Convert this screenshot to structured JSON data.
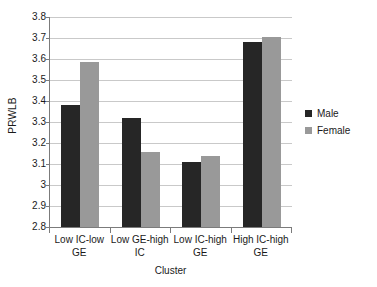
{
  "chart_data": {
    "type": "bar",
    "title": "",
    "subtitle": "",
    "xlabel": "Cluster",
    "ylabel": "PRWLB",
    "categories": [
      "Low IC-low GE",
      "Low GE-high IC",
      "Low IC-high GE",
      "High IC-high GE"
    ],
    "category_lines": [
      [
        "Low IC-low",
        "GE"
      ],
      [
        "Low GE-high",
        "IC"
      ],
      [
        "Low IC-high",
        "GE"
      ],
      [
        "High IC-high",
        "GE"
      ]
    ],
    "series": [
      {
        "name": "Male",
        "color": "#262626",
        "values": [
          3.38,
          3.32,
          3.11,
          3.68
        ]
      },
      {
        "name": "Female",
        "color": "#999999",
        "values": [
          3.585,
          3.155,
          3.14,
          3.705
        ]
      }
    ],
    "ylim": [
      2.8,
      3.8
    ],
    "ytick_step": 0.1,
    "ytick_labels": [
      "3.8",
      "3.7",
      "3.6",
      "3.5",
      "3.4",
      "3.3",
      "3.2",
      "3.1",
      "3",
      "2.9",
      "2.8"
    ],
    "ytick_values": [
      3.8,
      3.7,
      3.6,
      3.5,
      3.4,
      3.3,
      3.2,
      3.1,
      3.0,
      2.9,
      2.8
    ],
    "grid": true,
    "grid_axis": "y",
    "legend_position": "right",
    "legend_entries": [
      "Male",
      "Female"
    ],
    "axis_color": "#7b7b7b",
    "gridline_color": "#c9c9c9",
    "background_color": "#ffffff"
  }
}
